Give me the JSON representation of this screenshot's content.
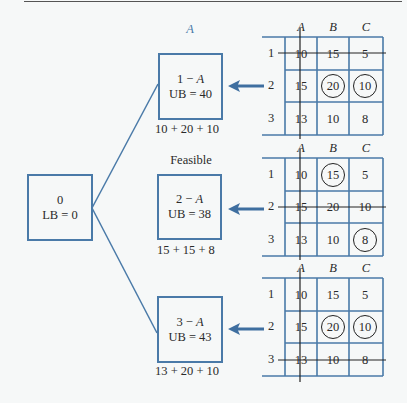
{
  "root": {
    "title": "0",
    "bound": "LB = 0"
  },
  "branches": [
    {
      "top_label": "A",
      "top_label_italic": true,
      "node_line1_num": "1",
      "node_line1_sep": " − ",
      "node_line1_var": "A",
      "bound": "UB = 40",
      "sum": "10 + 20 + 10",
      "table": {
        "columns": [
          "A",
          "B",
          "C"
        ],
        "rows": [
          {
            "label": "1",
            "cells": [
              "10",
              "15",
              "5"
            ],
            "struck": true
          },
          {
            "label": "2",
            "cells": [
              "15",
              "20",
              "10"
            ],
            "struck": false
          },
          {
            "label": "3",
            "cells": [
              "13",
              "10",
              "8"
            ],
            "struck": false
          }
        ],
        "circled": [
          [
            1,
            1
          ],
          [
            1,
            2
          ]
        ],
        "struck_column": "A",
        "arrow_row": "2"
      }
    },
    {
      "top_label": "Feasible",
      "top_label_italic": false,
      "node_line1_num": "2",
      "node_line1_sep": " − ",
      "node_line1_var": "A",
      "bound": "UB = 38",
      "sum": "15 + 15 + 8",
      "table": {
        "columns": [
          "A",
          "B",
          "C"
        ],
        "rows": [
          {
            "label": "1",
            "cells": [
              "10",
              "15",
              "5"
            ],
            "struck": false
          },
          {
            "label": "2",
            "cells": [
              "15",
              "20",
              "10"
            ],
            "struck": true
          },
          {
            "label": "3",
            "cells": [
              "13",
              "10",
              "8"
            ],
            "struck": false
          }
        ],
        "circled": [
          [
            0,
            1
          ],
          [
            2,
            2
          ]
        ],
        "struck_column": "A",
        "arrow_row": "2"
      }
    },
    {
      "top_label": "",
      "top_label_italic": false,
      "node_line1_num": "3",
      "node_line1_sep": " − ",
      "node_line1_var": "A",
      "bound": "UB = 43",
      "sum": "13 + 20 + 10",
      "table": {
        "columns": [
          "A",
          "B",
          "C"
        ],
        "rows": [
          {
            "label": "1",
            "cells": [
              "10",
              "15",
              "5"
            ],
            "struck": false
          },
          {
            "label": "2",
            "cells": [
              "15",
              "20",
              "10"
            ],
            "struck": false
          },
          {
            "label": "3",
            "cells": [
              "13",
              "10",
              "8"
            ],
            "struck": true
          }
        ],
        "circled": [
          [
            1,
            1
          ],
          [
            1,
            2
          ]
        ],
        "struck_column": "A",
        "arrow_row": "2"
      }
    }
  ],
  "colors": {
    "box": "#4a7aa8",
    "arrow": "#3f6fa0",
    "strike": "#222222",
    "circle": "#222222"
  }
}
